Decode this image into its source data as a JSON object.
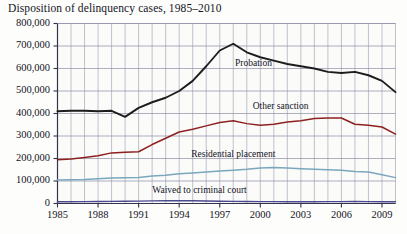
{
  "chart_data": {
    "type": "line",
    "title": "Disposition of delinquency cases, 1985–2010",
    "xlabel": "",
    "ylabel": "",
    "xlim": [
      1985,
      2010
    ],
    "ylim": [
      0,
      800000
    ],
    "grid": true,
    "legend_position": "inline-labels",
    "y_ticks": [
      "0",
      "100,000",
      "200,000",
      "300,000",
      "400,000",
      "500,000",
      "600,000",
      "700,000",
      "800,000"
    ],
    "y_tick_values": [
      0,
      100000,
      200000,
      300000,
      400000,
      500000,
      600000,
      700000,
      800000
    ],
    "x_ticks": [
      "1985",
      "1988",
      "1991",
      "1994",
      "1997",
      "2000",
      "2003",
      "2006",
      "2009"
    ],
    "x_tick_values": [
      1985,
      1988,
      1991,
      1994,
      1997,
      2000,
      2003,
      2006,
      2009
    ],
    "x": [
      1985,
      1986,
      1987,
      1988,
      1989,
      1990,
      1991,
      1992,
      1993,
      1994,
      1995,
      1996,
      1997,
      1998,
      1999,
      2000,
      2001,
      2002,
      2003,
      2004,
      2005,
      2006,
      2007,
      2008,
      2009,
      2010
    ],
    "series": [
      {
        "name": "Probation",
        "color": "#1d1d1d",
        "values": [
          410000,
          412000,
          412000,
          410000,
          412000,
          385000,
          425000,
          450000,
          470000,
          500000,
          545000,
          610000,
          680000,
          710000,
          672000,
          650000,
          635000,
          620000,
          610000,
          600000,
          585000,
          580000,
          585000,
          570000,
          545000,
          495000
        ]
      },
      {
        "name": "Other sanction",
        "color": "#8e2020",
        "values": [
          195000,
          198000,
          205000,
          212000,
          225000,
          228000,
          230000,
          262000,
          290000,
          318000,
          330000,
          345000,
          360000,
          368000,
          355000,
          348000,
          352000,
          362000,
          368000,
          378000,
          380000,
          380000,
          352000,
          348000,
          340000,
          308000
        ]
      },
      {
        "name": "Residential placement",
        "color": "#7aa7bd",
        "values": [
          105000,
          106000,
          107000,
          110000,
          113000,
          114000,
          116000,
          122000,
          126000,
          132000,
          136000,
          140000,
          144000,
          148000,
          152000,
          158000,
          160000,
          158000,
          155000,
          152000,
          150000,
          148000,
          142000,
          140000,
          128000,
          115000
        ]
      },
      {
        "name": "Waived to criminal court",
        "color": "#4b4b8f",
        "values": [
          7500,
          8000,
          8500,
          9000,
          9500,
          10000,
          10500,
          11500,
          12000,
          12500,
          12000,
          11000,
          10000,
          9500,
          9000,
          8500,
          8200,
          8000,
          8000,
          8000,
          8500,
          8500,
          8800,
          8500,
          8000,
          7500
        ]
      }
    ],
    "annotations": [
      {
        "text": "Probation",
        "x": 1999.5,
        "y": 620000
      },
      {
        "text": "Other sanction",
        "x": 2001.5,
        "y": 430000
      },
      {
        "text": "Residential placement",
        "x": 1998.0,
        "y": 215000
      },
      {
        "text": "Waived to criminal court",
        "x": 1995.5,
        "y": 55000
      }
    ]
  }
}
